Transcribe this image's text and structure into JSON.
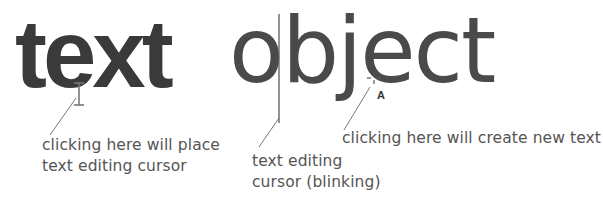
{
  "sample_text": {
    "bold_word": "text",
    "light_word": "object"
  },
  "annotations": [
    {
      "id": "place-cursor",
      "lines": [
        "clicking here will place",
        "text editing cursor"
      ],
      "cursor_icon": "i-beam-cursor-icon"
    },
    {
      "id": "caret",
      "lines": [
        "text editing",
        "cursor (blinking)"
      ],
      "cursor_icon": "text-caret-icon"
    },
    {
      "id": "create-text",
      "lines": [
        "clicking here will create new text"
      ],
      "cursor_icon": "type-tool-crosshair-icon"
    }
  ],
  "colors": {
    "bold_text": "#3a3a3a",
    "light_text": "#4a4a4a",
    "label_text": "#555555",
    "leader_line": "#777777",
    "background": "#ffffff"
  }
}
